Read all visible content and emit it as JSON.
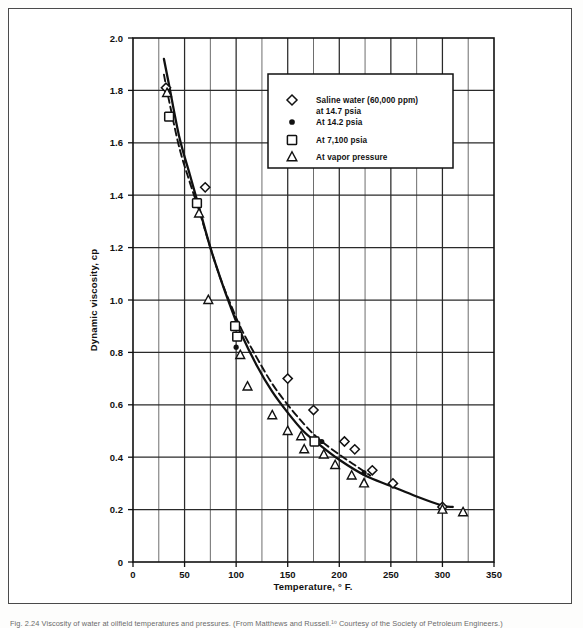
{
  "figure": {
    "caption": "Fig. 2.24  Viscosity of water at oilfield temperatures and pressures. (From Matthews and Russell.¹⁰  Courtesy of the Society of Petroleum Engineers.)"
  },
  "chart_data": {
    "type": "scatter",
    "title": "",
    "xlabel": "Temperature, ° F.",
    "ylabel": "Dynamic viscosity, cp",
    "xlim": [
      0,
      350
    ],
    "ylim": [
      0,
      2.0
    ],
    "xticks": [
      0,
      50,
      100,
      150,
      200,
      250,
      300,
      350
    ],
    "xtick_labels": [
      "0",
      "50",
      "100",
      "150",
      "200",
      "250",
      "300",
      "350"
    ],
    "yticks": [
      0,
      0.2,
      0.4,
      0.6,
      0.8,
      1.0,
      1.2,
      1.4,
      1.6,
      1.8,
      2.0
    ],
    "ytick_labels": [
      "0",
      "0.2",
      "0.4",
      "0.6",
      "0.8",
      "1.0",
      "1.2",
      "1.4",
      "1.6",
      "1.8",
      "2.0"
    ],
    "grid": true,
    "grid_minor_x_step": 25,
    "legend_position": "upper-right-inside",
    "series": [
      {
        "name": "Saline water (60,000 ppm) at 14.7 psia",
        "marker": "diamond",
        "points": [
          [
            32,
            1.81
          ],
          [
            70,
            1.43
          ],
          [
            150,
            0.7
          ],
          [
            175,
            0.58
          ],
          [
            205,
            0.46
          ],
          [
            215,
            0.43
          ],
          [
            232,
            0.35
          ],
          [
            252,
            0.3
          ],
          [
            300,
            0.21
          ]
        ]
      },
      {
        "name": "At 14.2 psia",
        "marker": "filled-circle",
        "points": [
          [
            100,
            0.82
          ],
          [
            183,
            0.46
          ],
          [
            224,
            0.34
          ]
        ]
      },
      {
        "name": "At 7,100 psia",
        "marker": "square",
        "points": [
          [
            35,
            1.7
          ],
          [
            62,
            1.37
          ],
          [
            99,
            0.9
          ],
          [
            101,
            0.86
          ],
          [
            176,
            0.46
          ]
        ]
      },
      {
        "name": "At vapor pressure",
        "marker": "triangle",
        "points": [
          [
            33,
            1.79
          ],
          [
            64,
            1.33
          ],
          [
            73,
            1.0
          ],
          [
            104,
            0.79
          ],
          [
            111,
            0.67
          ],
          [
            135,
            0.56
          ],
          [
            150,
            0.5
          ],
          [
            163,
            0.48
          ],
          [
            166,
            0.43
          ],
          [
            185,
            0.41
          ],
          [
            196,
            0.37
          ],
          [
            212,
            0.33
          ],
          [
            224,
            0.3
          ],
          [
            300,
            0.2
          ],
          [
            320,
            0.19
          ]
        ]
      }
    ],
    "curves": [
      {
        "name": "solid-curve",
        "style": "solid",
        "points": [
          [
            30,
            1.92
          ],
          [
            35,
            1.82
          ],
          [
            45,
            1.62
          ],
          [
            55,
            1.48
          ],
          [
            65,
            1.34
          ],
          [
            75,
            1.2
          ],
          [
            85,
            1.08
          ],
          [
            95,
            0.97
          ],
          [
            105,
            0.87
          ],
          [
            120,
            0.75
          ],
          [
            135,
            0.65
          ],
          [
            150,
            0.57
          ],
          [
            165,
            0.5
          ],
          [
            180,
            0.45
          ],
          [
            200,
            0.39
          ],
          [
            225,
            0.33
          ],
          [
            250,
            0.29
          ],
          [
            275,
            0.25
          ],
          [
            300,
            0.215
          ],
          [
            310,
            0.21
          ]
        ]
      },
      {
        "name": "dashed-curve",
        "style": "dashed",
        "points": [
          [
            30,
            1.86
          ],
          [
            35,
            1.76
          ],
          [
            45,
            1.58
          ],
          [
            55,
            1.45
          ],
          [
            65,
            1.33
          ],
          [
            75,
            1.2
          ],
          [
            85,
            1.08
          ],
          [
            95,
            0.98
          ],
          [
            105,
            0.89
          ],
          [
            120,
            0.78
          ],
          [
            135,
            0.68
          ],
          [
            150,
            0.6
          ],
          [
            165,
            0.53
          ],
          [
            180,
            0.47
          ],
          [
            200,
            0.41
          ],
          [
            215,
            0.37
          ],
          [
            230,
            0.33
          ]
        ]
      }
    ]
  },
  "legend": {
    "entries": [
      {
        "marker": "diamond",
        "label_line1": "Saline water (60,000 ppm)",
        "label_line2": "at 14.7 psia"
      },
      {
        "marker": "filled-circle",
        "label_line1": "At 14.2 psia",
        "label_line2": ""
      },
      {
        "marker": "square",
        "label_line1": "At 7,100 psia",
        "label_line2": ""
      },
      {
        "marker": "triangle",
        "label_line1": "At vapor pressure",
        "label_line2": ""
      }
    ]
  },
  "colors": {
    "ink": "#111111",
    "grid": "#2a2a2a",
    "frame": "#4a4a4a",
    "paper": "#ffffff"
  }
}
